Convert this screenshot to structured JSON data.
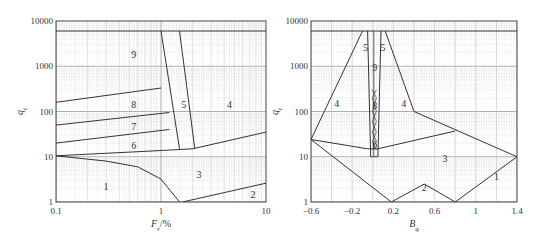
{
  "chart_data": [
    {
      "type": "line",
      "title": "",
      "panel": "left",
      "xlabel": "F_r/%",
      "ylabel": "q_t",
      "xscale": "log",
      "yscale": "log",
      "xlim": [
        0.1,
        10
      ],
      "ylim": [
        1,
        10000
      ],
      "x_ticks": [
        "0.1",
        "1",
        "10"
      ],
      "y_ticks": [
        "1",
        "10",
        "100",
        "1000",
        "10000"
      ],
      "grid": true,
      "regions": [
        {
          "label": "1",
          "x": 0.3,
          "y": 2.2
        },
        {
          "label": "2",
          "x": 7.5,
          "y": 1.4
        },
        {
          "label": "3",
          "x": 2.3,
          "y": 4
        },
        {
          "label": "4",
          "x": 4.5,
          "y": 140
        },
        {
          "label": "5",
          "x": 1.65,
          "y": 140
        },
        {
          "label": "6",
          "x": 0.55,
          "y": 17
        },
        {
          "label": "7",
          "x": 0.55,
          "y": 45
        },
        {
          "label": "8",
          "x": 0.55,
          "y": 140
        },
        {
          "label": "9",
          "x": 0.55,
          "y": 1800
        }
      ],
      "boundaries": [
        {
          "name": "top",
          "points": [
            [
              0.1,
              6000
            ],
            [
              10,
              6000
            ]
          ]
        },
        {
          "name": "b1-3",
          "points": [
            [
              0.1,
              10.5
            ],
            [
              0.3,
              8
            ],
            [
              0.6,
              6
            ],
            [
              1,
              3.2
            ],
            [
              1.5,
              1
            ]
          ]
        },
        {
          "name": "b2-3",
          "points": [
            [
              1.6,
              1
            ],
            [
              10,
              2.6
            ]
          ]
        },
        {
          "name": "b3-6",
          "points": [
            [
              0.1,
              10.5
            ],
            [
              1.2,
              14
            ],
            [
              2,
              15
            ],
            [
              10,
              35
            ]
          ]
        },
        {
          "name": "b6-7",
          "points": [
            [
              0.1,
              20
            ],
            [
              1.2,
              40
            ]
          ]
        },
        {
          "name": "b7-8",
          "points": [
            [
              0.1,
              50
            ],
            [
              1.2,
              95
            ]
          ]
        },
        {
          "name": "b8-9",
          "points": [
            [
              0.1,
              160
            ],
            [
              1,
              330
            ]
          ]
        },
        {
          "name": "b5-left",
          "points": [
            [
              1,
              6000
            ],
            [
              1.5,
              15
            ]
          ]
        },
        {
          "name": "b5-right",
          "points": [
            [
              1.5,
              6000
            ],
            [
              2.1,
              15
            ]
          ]
        }
      ]
    },
    {
      "type": "line",
      "title": "",
      "panel": "right",
      "xlabel": "B_q",
      "ylabel": "q_t",
      "xscale": "linear",
      "yscale": "log",
      "xlim": [
        -0.6,
        1.4
      ],
      "ylim": [
        1,
        10000
      ],
      "x_ticks": [
        "-0.6",
        "-0.2",
        "0.2",
        "0.6",
        "1",
        "1.4"
      ],
      "y_ticks": [
        "1",
        "10",
        "100",
        "1000",
        "10000"
      ],
      "grid": true,
      "regions": [
        {
          "label": "1",
          "x": 1.2,
          "y": 3.5
        },
        {
          "label": "2",
          "x": 0.5,
          "y": 2
        },
        {
          "label": "3",
          "x": 0.7,
          "y": 9
        },
        {
          "label": "4",
          "x": -0.35,
          "y": 150
        },
        {
          "label": "4",
          "x": 0.3,
          "y": 150
        },
        {
          "label": "5",
          "x": -0.07,
          "y": 2500
        },
        {
          "label": "5",
          "x": 0.1,
          "y": 2500
        },
        {
          "label": "9",
          "x": 0.02,
          "y": 900
        },
        {
          "label": "8",
          "x": 0.02,
          "y": 130
        },
        {
          "label": "6",
          "x": 0.02,
          "y": 18
        }
      ],
      "boundaries": [
        {
          "name": "top",
          "points": [
            [
              -0.6,
              6000
            ],
            [
              1.4,
              6000
            ]
          ]
        },
        {
          "name": "outer-left",
          "points": [
            [
              -0.6,
              24
            ],
            [
              -0.1,
              6000
            ]
          ]
        },
        {
          "name": "outer-right",
          "points": [
            [
              0.12,
              6000
            ],
            [
              0.4,
              100
            ],
            [
              1.4,
              10
            ]
          ]
        },
        {
          "name": "b3-upper",
          "points": [
            [
              -0.6,
              24
            ],
            [
              -0.05,
              15
            ],
            [
              0.05,
              15
            ],
            [
              0.8,
              37
            ]
          ]
        },
        {
          "name": "b3-lower",
          "points": [
            [
              -0.6,
              24
            ],
            [
              0.18,
              1
            ],
            [
              0.5,
              2.5
            ],
            [
              0.8,
              1
            ],
            [
              1.4,
              10
            ]
          ]
        },
        {
          "name": "column-left",
          "points": [
            [
              -0.05,
              6000
            ],
            [
              -0.02,
              10
            ]
          ]
        },
        {
          "name": "column-right",
          "points": [
            [
              0.08,
              6000
            ],
            [
              0.05,
              10
            ]
          ]
        }
      ]
    }
  ],
  "caption": ""
}
